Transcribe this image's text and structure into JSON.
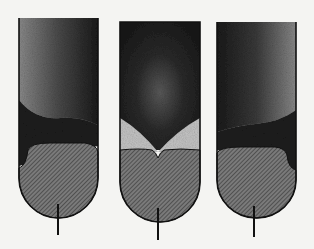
{
  "figure": {
    "colors": {
      "background": "#f4f4f2",
      "outline": "#111111",
      "stipple_dark": "#1c1c1c",
      "hatch_fill": "#6a6a6a",
      "light_region": "#bdbdbd"
    },
    "tubes": [
      {
        "id": "left",
        "interface": "tilted, dark layer on left wall"
      },
      {
        "id": "middle",
        "interface": "central dip with light wedges on both sides"
      },
      {
        "id": "right",
        "interface": "tilted, dark layer on right wall"
      }
    ]
  }
}
